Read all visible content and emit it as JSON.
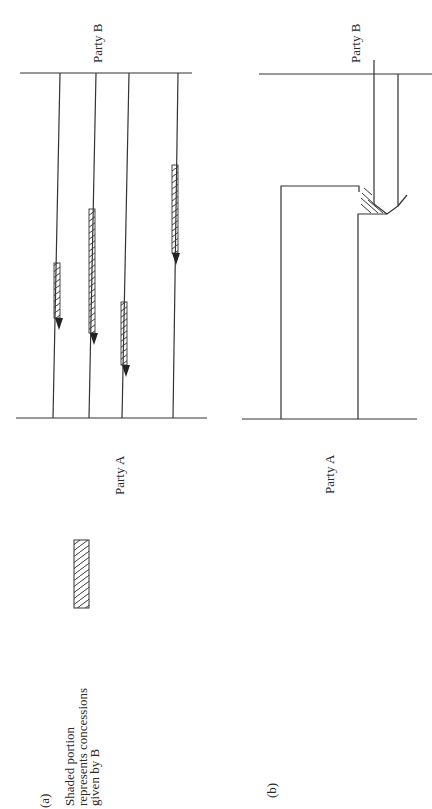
{
  "panel_a": {
    "label": "(a)",
    "party_top": "Party B",
    "party_bottom": "Party A",
    "legend": {
      "lines": [
        "Shaded portion",
        "represents concessions",
        "given by B"
      ]
    },
    "arrows": [
      {
        "x": 60,
        "hatch_start": 263,
        "hatch_end": 318,
        "tip": 330
      },
      {
        "x": 96,
        "hatch_start": 209,
        "hatch_end": 333,
        "tip": 345
      },
      {
        "x": 129,
        "hatch_start": 302,
        "hatch_end": 365,
        "tip": 377
      },
      {
        "x": 178,
        "hatch_start": 165,
        "hatch_end": 253,
        "tip": 265
      }
    ]
  },
  "panel_b": {
    "label": "(b)",
    "party_top": "Party B",
    "party_bottom": "Party A"
  },
  "colors": {
    "ink": "#333333",
    "background": "#ffffff"
  }
}
